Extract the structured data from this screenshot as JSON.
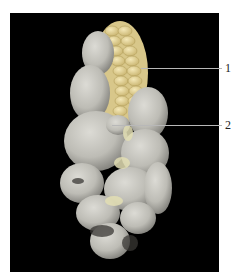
{
  "figure": {
    "background_color": "#000000",
    "specimen_colors": {
      "gall": "#c9c8c2",
      "gall_shadow": "#8d8c87",
      "kernel": "#e8d9a0",
      "kernel_shadow": "#c4b06e",
      "dark_spore_mass": "#3a3835"
    },
    "labels": [
      {
        "text": "1",
        "target": "kernels",
        "line_y": 68
      },
      {
        "text": "2",
        "target": "gall",
        "line_y": 125
      }
    ]
  }
}
